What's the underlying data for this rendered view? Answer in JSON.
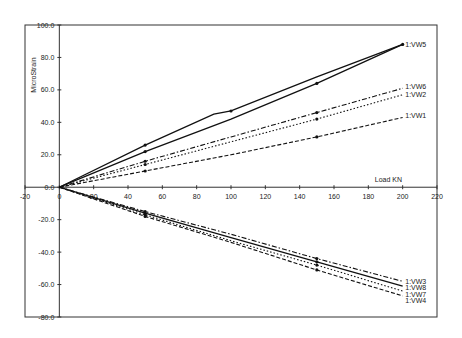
{
  "chart_data": {
    "type": "line",
    "title": "",
    "xlabel": "Load KN",
    "ylabel": "MicroStrain",
    "xlim": [
      -20,
      220
    ],
    "ylim": [
      -80,
      100
    ],
    "grid": false,
    "x_ticks": [
      -20,
      0,
      20,
      40,
      60,
      80,
      100,
      120,
      140,
      160,
      180,
      200,
      220
    ],
    "x_tick_labels": [
      "-20",
      "0",
      "20",
      "40",
      "60",
      "80",
      "100",
      "120",
      "140",
      "160",
      "180",
      "200",
      "220"
    ],
    "y_ticks": [
      100,
      80,
      60,
      40,
      20,
      0,
      -20,
      -40,
      -60,
      -80
    ],
    "y_tick_labels": [
      "100.0",
      "80.0",
      "60.0",
      "40.0",
      "20.0",
      "0.0",
      "-20.0",
      "-40.0",
      "-60.0",
      "-80.0"
    ],
    "legend": "series labels at line ends (right)",
    "series": [
      {
        "name": "1:VW5",
        "style": "solid",
        "x": [
          0,
          50,
          90,
          100,
          150,
          200
        ],
        "y": [
          0,
          26,
          45,
          47,
          68,
          88
        ]
      },
      {
        "name": "1:VW5 (return)",
        "style": "solid",
        "x": [
          0,
          50,
          100,
          150,
          200
        ],
        "y": [
          0,
          22,
          42,
          64,
          88
        ]
      },
      {
        "name": "1:VW6",
        "style": "dashdot",
        "x": [
          0,
          50,
          100,
          150,
          200
        ],
        "y": [
          0,
          16,
          31,
          46,
          61
        ]
      },
      {
        "name": "1:VW2",
        "style": "dotted",
        "x": [
          0,
          50,
          100,
          150,
          200
        ],
        "y": [
          0,
          14,
          28,
          42,
          57
        ]
      },
      {
        "name": "1:VW1",
        "style": "dashed",
        "x": [
          0,
          50,
          100,
          150,
          200
        ],
        "y": [
          0,
          10,
          20,
          31,
          43
        ]
      },
      {
        "name": "1:VW3",
        "style": "dashdot",
        "x": [
          0,
          50,
          100,
          150,
          200
        ],
        "y": [
          0,
          -15,
          -29,
          -44,
          -58
        ]
      },
      {
        "name": "1:VW8",
        "style": "solid",
        "x": [
          0,
          50,
          100,
          150,
          200
        ],
        "y": [
          0,
          -16,
          -31,
          -46,
          -61
        ]
      },
      {
        "name": "1:VW7",
        "style": "dotted",
        "x": [
          0,
          50,
          100,
          150,
          200
        ],
        "y": [
          0,
          -17,
          -33,
          -48,
          -64
        ]
      },
      {
        "name": "1:VW4",
        "style": "dashed",
        "x": [
          0,
          50,
          100,
          150,
          200
        ],
        "y": [
          0,
          -18,
          -34,
          -51,
          -67
        ]
      }
    ],
    "label_positions_y": [
      88,
      null,
      62,
      57,
      44,
      -58,
      -62,
      -66,
      -70
    ]
  }
}
